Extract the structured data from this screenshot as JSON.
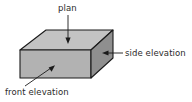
{
  "diagram": {
    "background_color": "#ffffff",
    "stroke_color": "#1a1a1a",
    "faces": {
      "top": {
        "name": "plan",
        "fill_color": "#c3c3c3"
      },
      "front": {
        "name": "front elevation",
        "fill_color": "#b2b2b2"
      },
      "side": {
        "name": "side elevation",
        "fill_color": "#8f8f8f"
      }
    },
    "labels": {
      "plan": "plan",
      "side_elevation": "side elevation",
      "front_elevation": "front elevation"
    },
    "annotations": [
      {
        "label": "plan",
        "points_to": "top-face",
        "direction": "down"
      },
      {
        "label": "side elevation",
        "points_to": "side-face",
        "direction": "left"
      },
      {
        "label": "front elevation",
        "points_to": "front-face",
        "direction": "up-right"
      }
    ]
  }
}
